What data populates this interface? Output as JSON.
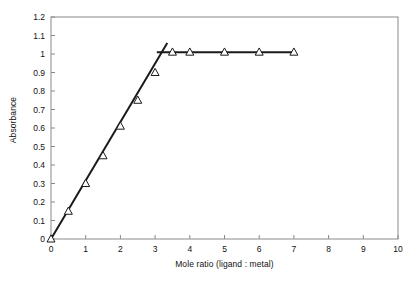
{
  "chart_data": {
    "type": "scatter",
    "title": "",
    "xlabel": "Mole ratio (ligand : metal)",
    "ylabel": "Absorbance",
    "xlim": [
      0,
      10
    ],
    "ylim": [
      0,
      1.2
    ],
    "xticks": [
      0,
      1,
      2,
      3,
      4,
      5,
      6,
      7,
      8,
      9,
      10
    ],
    "xtick_labels": [
      "0",
      "1",
      "2",
      "3",
      "4",
      "5",
      "6",
      "7",
      "8",
      "9",
      "10"
    ],
    "yticks": [
      0,
      0.1,
      0.2,
      0.3,
      0.4,
      0.5,
      0.6,
      0.7,
      0.8,
      0.9,
      1.0,
      1.1,
      1.2
    ],
    "ytick_labels": [
      "0",
      "0.1",
      "0.2",
      "0.3",
      "0.4",
      "0.5",
      "0.6",
      "0.7",
      "0.8",
      "0.9",
      "1",
      "1.1",
      "1.2"
    ],
    "grid": false,
    "legend": null,
    "marker": "open-triangle",
    "series": [
      {
        "name": "Absorbance vs mole ratio",
        "marker": "open-triangle",
        "points": [
          {
            "x": 0.0,
            "y": 0.0
          },
          {
            "x": 0.5,
            "y": 0.15
          },
          {
            "x": 1.0,
            "y": 0.3
          },
          {
            "x": 1.5,
            "y": 0.45
          },
          {
            "x": 2.0,
            "y": 0.61
          },
          {
            "x": 2.5,
            "y": 0.75
          },
          {
            "x": 3.0,
            "y": 0.9
          },
          {
            "x": 3.5,
            "y": 1.01
          },
          {
            "x": 4.0,
            "y": 1.01
          },
          {
            "x": 5.0,
            "y": 1.01
          },
          {
            "x": 6.0,
            "y": 1.01
          },
          {
            "x": 7.0,
            "y": 1.01
          }
        ]
      }
    ],
    "fit_lines": [
      {
        "name": "rising-branch",
        "x1": 0.0,
        "y1": 0.0,
        "x2": 3.35,
        "y2": 1.06
      },
      {
        "name": "plateau-branch",
        "x1": 3.05,
        "y1": 1.01,
        "x2": 7.0,
        "y2": 1.01
      }
    ],
    "annotations": []
  },
  "colors": {
    "line": "#1a1a1a",
    "marker_stroke": "#1a1a1a",
    "marker_fill": "#ffffff",
    "frame": "#8a8a8a",
    "background": "#ffffff",
    "text": "#111111"
  }
}
